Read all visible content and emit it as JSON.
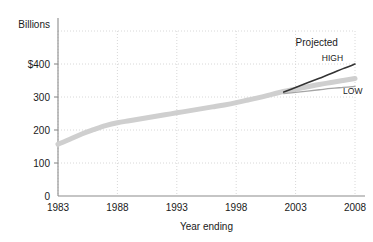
{
  "chart_data": {
    "type": "line",
    "title": "",
    "subtitle": "",
    "xlabel": "Year ending",
    "ylabel": "Billions",
    "ylim": [
      0,
      500
    ],
    "xlim": [
      1983,
      2008
    ],
    "grid": true,
    "legend_position": "inline-annotations",
    "y_unit_label": "Billions",
    "y_ticks": [
      "$400",
      "300",
      "200",
      "100",
      "0"
    ],
    "y_tick_values": [
      400,
      300,
      200,
      100,
      0
    ],
    "x_ticks": [
      "1983",
      "1988",
      "1993",
      "1998",
      "2003",
      "2008"
    ],
    "x_tick_values": [
      1983,
      1988,
      1993,
      1998,
      2003,
      2008
    ],
    "annotations": [
      {
        "text": "Projected",
        "x": 2003,
        "y": 455
      },
      {
        "text": "HIGH",
        "x": 2007,
        "y": 408
      },
      {
        "text": "LOW",
        "x": 2007,
        "y": 310
      }
    ],
    "series": [
      {
        "name": "Actual",
        "style": "thick-gray-band",
        "color": "#cfcfcf",
        "x": [
          1983,
          1984,
          1985,
          1986,
          1987,
          1988,
          1989,
          1990,
          1991,
          1992,
          1993,
          1994,
          1995,
          1996,
          1997,
          1998,
          1999,
          2000,
          2001,
          2002
        ],
        "values": [
          157,
          172,
          188,
          201,
          213,
          222,
          228,
          234,
          240,
          246,
          252,
          258,
          264,
          270,
          276,
          283,
          291,
          299,
          308,
          317
        ]
      },
      {
        "name": "Projected middle",
        "style": "thick-gray-band",
        "color": "#cfcfcf",
        "x": [
          2002,
          2003,
          2004,
          2005,
          2006,
          2007,
          2008
        ],
        "values": [
          317,
          324,
          331,
          338,
          344,
          350,
          356
        ]
      },
      {
        "name": "HIGH",
        "style": "dark-line",
        "color": "#333333",
        "x": [
          2002,
          2003,
          2004,
          2005,
          2006,
          2007,
          2008
        ],
        "values": [
          315,
          329,
          343,
          357,
          371,
          386,
          400
        ]
      },
      {
        "name": "LOW",
        "style": "thin-gray-line",
        "color": "#a5a5a5",
        "x": [
          2002,
          2003,
          2004,
          2005,
          2006,
          2007,
          2008
        ],
        "values": [
          310,
          314,
          318,
          322,
          326,
          329,
          332
        ]
      }
    ]
  }
}
